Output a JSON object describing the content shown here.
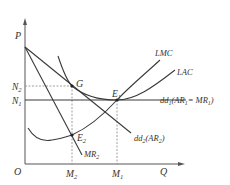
{
  "diagram": {
    "type": "economics-monopolistic-competition-long-run",
    "axes": {
      "y_label": "P",
      "x_label": "Q",
      "origin_label": "O"
    },
    "price_levels": [
      {
        "id": "N2",
        "label": "N",
        "sub": "2"
      },
      {
        "id": "N1",
        "label": "N",
        "sub": "1"
      }
    ],
    "quantity_levels": [
      {
        "id": "M2",
        "label": "M",
        "sub": "2"
      },
      {
        "id": "M1",
        "label": "M",
        "sub": "1"
      }
    ],
    "points": [
      {
        "id": "G",
        "label": "G",
        "sub": ""
      },
      {
        "id": "E1",
        "label": "E",
        "sub": "1"
      },
      {
        "id": "E2",
        "label": "E",
        "sub": "2"
      }
    ],
    "curves": {
      "lmc": {
        "label": "LMC"
      },
      "lac": {
        "label": "LAC"
      },
      "dd1": {
        "label_a": "dd",
        "sub_a": "1",
        "label_b": "(AR",
        "sub_b": "1",
        "label_c": "= MR",
        "sub_c": "1",
        "label_d": ")"
      },
      "dd2": {
        "label_a": "dd",
        "sub_a": "2",
        "label_b": "(AR",
        "sub_b": "2",
        "label_c": ")"
      },
      "mr2": {
        "label": "MR",
        "sub": "2"
      }
    }
  }
}
